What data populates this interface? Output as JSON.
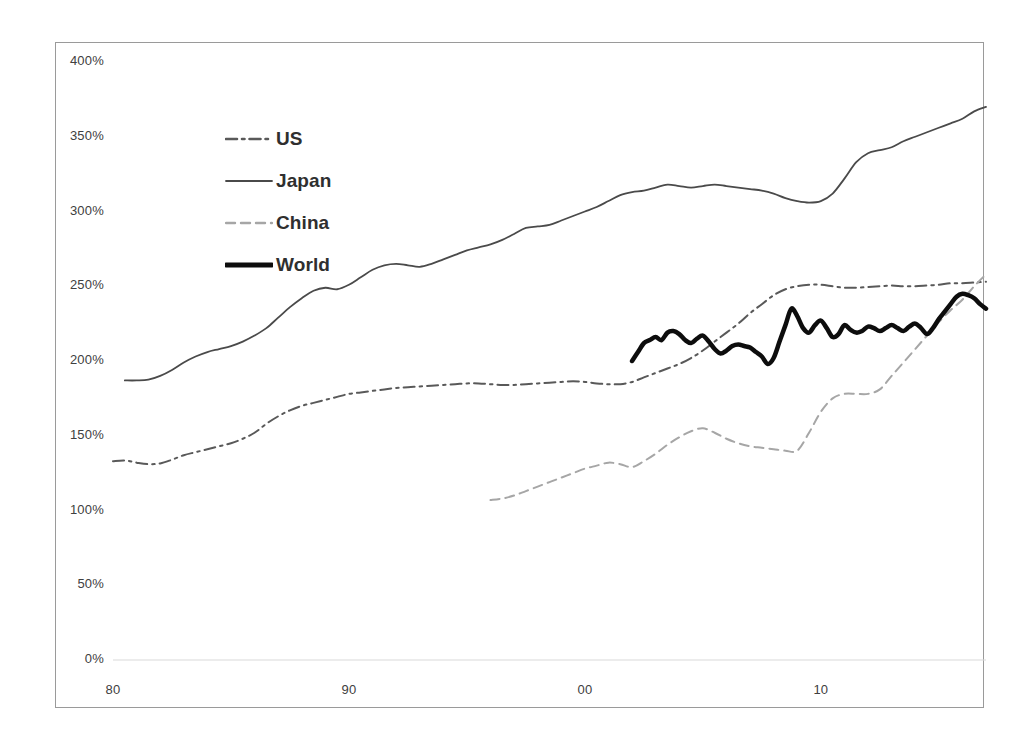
{
  "chart_data": {
    "type": "line",
    "title": "",
    "subtitle": "",
    "xlabel": "",
    "ylabel": "",
    "xlim": [
      1980,
      2017
    ],
    "ylim": [
      0,
      400
    ],
    "y_tick_labels": [
      "400%",
      "350%",
      "300%",
      "250%",
      "200%",
      "150%",
      "100%",
      "50%",
      "0%"
    ],
    "y_tick_values": [
      400,
      350,
      300,
      250,
      200,
      150,
      100,
      50,
      0
    ],
    "x_tick_labels": [
      "80",
      "90",
      "00",
      "10"
    ],
    "x_tick_values": [
      1980,
      1990,
      2000,
      2010
    ],
    "grid": false,
    "baseline_gridline": true,
    "legend_position": "inside-upper-left",
    "units": "percent of GDP",
    "series": [
      {
        "name": "US",
        "style": "dash-dot",
        "color": "#595959",
        "width": 2,
        "x_start": 1980,
        "x": [
          1980,
          1980.5,
          1981,
          1981.5,
          1982,
          1982.5,
          1983,
          1983.5,
          1984,
          1984.5,
          1985,
          1985.5,
          1986,
          1986.5,
          1987,
          1987.5,
          1988,
          1988.5,
          1989,
          1989.5,
          1990,
          1990.5,
          1991,
          1991.5,
          1992,
          1992.5,
          1993,
          1993.5,
          1994,
          1994.5,
          1995,
          1995.5,
          1996,
          1996.5,
          1997,
          1997.5,
          1998,
          1998.5,
          1999,
          1999.5,
          2000,
          2000.5,
          2001,
          2001.5,
          2002,
          2002.5,
          2003,
          2003.5,
          2004,
          2004.5,
          2005,
          2005.5,
          2006,
          2006.5,
          2007,
          2007.5,
          2008,
          2008.5,
          2009,
          2009.5,
          2010,
          2010.5,
          2011,
          2011.5,
          2012,
          2012.5,
          2013,
          2013.5,
          2014,
          2014.5,
          2015,
          2015.5,
          2016,
          2016.5,
          2017
        ],
        "values": [
          133,
          133.5,
          132,
          131,
          131.5,
          134,
          137,
          139,
          141,
          143,
          145,
          148,
          152,
          158,
          163,
          167,
          170,
          172,
          174,
          176,
          178,
          179,
          180,
          181,
          182,
          182.5,
          183,
          183.5,
          184,
          184.5,
          185,
          185,
          184.5,
          184,
          184,
          184.5,
          185,
          185.5,
          186,
          186.5,
          186,
          185,
          184.5,
          184.5,
          186,
          189,
          192,
          195,
          198,
          202,
          207,
          213,
          219,
          225,
          232,
          238,
          244,
          248,
          250,
          251,
          251,
          250,
          249,
          249,
          249.5,
          250,
          250.5,
          250,
          250,
          250.5,
          251,
          252,
          252,
          252.5,
          253
        ]
      },
      {
        "name": "Japan",
        "style": "solid-thin",
        "color": "#4a4a4a",
        "width": 1.8,
        "x_start": 1980.5,
        "x": [
          1980.5,
          1981,
          1981.5,
          1982,
          1982.5,
          1983,
          1983.5,
          1984,
          1984.5,
          1985,
          1985.5,
          1986,
          1986.5,
          1987,
          1987.5,
          1988,
          1988.5,
          1989,
          1989.5,
          1990,
          1990.5,
          1991,
          1991.5,
          1992,
          1992.5,
          1993,
          1993.5,
          1994,
          1994.5,
          1995,
          1995.5,
          1996,
          1996.5,
          1997,
          1997.5,
          1998,
          1998.5,
          1999,
          1999.5,
          2000,
          2000.5,
          2001,
          2001.5,
          2002,
          2002.5,
          2003,
          2003.5,
          2004,
          2004.5,
          2005,
          2005.5,
          2006,
          2006.5,
          2007,
          2007.5,
          2008,
          2008.5,
          2009,
          2009.5,
          2010,
          2010.5,
          2011,
          2011.5,
          2012,
          2012.5,
          2013,
          2013.5,
          2014,
          2014.5,
          2015,
          2015.5,
          2016,
          2016.5,
          2017
        ],
        "values": [
          187,
          187,
          187.5,
          190,
          194,
          199,
          203,
          206,
          208,
          210,
          213,
          217,
          222,
          229,
          236,
          242,
          247,
          249,
          248,
          251,
          256,
          261,
          264,
          265,
          264,
          263,
          265,
          268,
          271,
          274,
          276,
          278,
          281,
          285,
          289,
          290,
          291,
          294,
          297,
          300,
          303,
          307,
          311,
          313,
          314,
          316,
          318,
          317,
          316,
          317,
          318,
          317,
          316,
          315,
          314,
          312,
          309,
          307,
          306,
          307,
          312,
          322,
          333,
          339,
          341,
          343,
          347,
          350,
          353,
          356,
          359,
          362,
          367,
          370
        ]
      },
      {
        "name": "China",
        "style": "dashed",
        "color": "#a6a6a6",
        "width": 2,
        "x_start": 1996,
        "x": [
          1996,
          1996.5,
          1997,
          1997.5,
          1998,
          1998.5,
          1999,
          1999.5,
          2000,
          2000.5,
          2001,
          2001.5,
          2002,
          2002.5,
          2003,
          2003.5,
          2004,
          2004.5,
          2005,
          2005.5,
          2006,
          2006.5,
          2007,
          2007.5,
          2008,
          2008.5,
          2009,
          2009.5,
          2010,
          2010.5,
          2011,
          2011.5,
          2012,
          2012.5,
          2013,
          2013.5,
          2014,
          2014.5,
          2015,
          2015.5,
          2016,
          2016.5,
          2017
        ],
        "values": [
          107,
          108,
          110,
          113,
          116,
          119,
          122,
          125,
          128,
          130,
          132,
          131,
          129,
          133,
          138,
          144,
          149,
          153,
          155,
          152,
          148,
          145,
          143,
          142,
          141,
          140,
          140,
          152,
          166,
          175,
          178,
          178,
          178,
          181,
          190,
          199,
          208,
          217,
          226,
          234,
          241,
          250,
          258
        ]
      },
      {
        "name": "World",
        "style": "solid-thick",
        "color": "#0d0d0d",
        "width": 4.5,
        "x_start": 2002,
        "x": [
          2002,
          2002.25,
          2002.5,
          2002.75,
          2003,
          2003.25,
          2003.5,
          2003.75,
          2004,
          2004.25,
          2004.5,
          2004.75,
          2005,
          2005.25,
          2005.5,
          2005.75,
          2006,
          2006.25,
          2006.5,
          2006.75,
          2007,
          2007.25,
          2007.5,
          2007.75,
          2008,
          2008.25,
          2008.5,
          2008.75,
          2009,
          2009.25,
          2009.5,
          2009.75,
          2010,
          2010.25,
          2010.5,
          2010.75,
          2011,
          2011.25,
          2011.5,
          2011.75,
          2012,
          2012.25,
          2012.5,
          2012.75,
          2013,
          2013.25,
          2013.5,
          2013.75,
          2014,
          2014.25,
          2014.5,
          2014.75,
          2015,
          2015.25,
          2015.5,
          2015.75,
          2016,
          2016.25,
          2016.5,
          2016.75,
          2017
        ],
        "values": [
          200,
          206,
          212,
          214,
          216,
          214,
          219,
          220,
          218,
          214,
          212,
          215,
          217,
          213,
          208,
          205,
          207,
          210,
          211,
          210,
          209,
          206,
          203,
          198,
          202,
          213,
          224,
          235,
          230,
          222,
          219,
          224,
          227,
          222,
          216,
          218,
          224,
          221,
          219,
          220,
          223,
          222,
          220,
          222,
          224,
          222,
          220,
          223,
          225,
          222,
          218,
          222,
          228,
          233,
          238,
          243,
          245,
          244,
          242,
          238,
          235
        ]
      }
    ]
  },
  "axes": {
    "y_ticks": [
      {
        "label": "400%",
        "value": 400
      },
      {
        "label": "350%",
        "value": 350
      },
      {
        "label": "300%",
        "value": 300
      },
      {
        "label": "250%",
        "value": 250
      },
      {
        "label": "200%",
        "value": 200
      },
      {
        "label": "150%",
        "value": 150
      },
      {
        "label": "100%",
        "value": 100
      },
      {
        "label": "50%",
        "value": 50
      },
      {
        "label": "0%",
        "value": 0
      }
    ],
    "x_ticks": [
      {
        "label": "80",
        "value": 1980
      },
      {
        "label": "90",
        "value": 1990
      },
      {
        "label": "00",
        "value": 2000
      },
      {
        "label": "10",
        "value": 2010
      }
    ]
  },
  "legend": {
    "items": [
      {
        "label": "US",
        "style": "dash-dot",
        "color": "#595959"
      },
      {
        "label": "Japan",
        "style": "solid-thin",
        "color": "#4a4a4a"
      },
      {
        "label": "China",
        "style": "dashed",
        "color": "#a6a6a6"
      },
      {
        "label": "World",
        "style": "solid-thick",
        "color": "#0d0d0d"
      }
    ]
  },
  "colors": {
    "background": "#ffffff",
    "frame": "#9a9a9a",
    "baseline": "#d9d9d9",
    "tick_text": "#404040"
  }
}
